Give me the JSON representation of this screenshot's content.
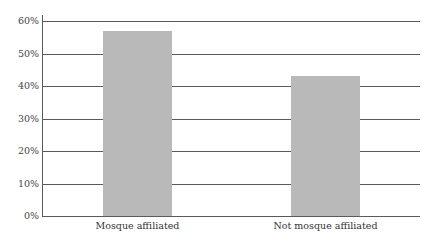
{
  "chart_data": {
    "type": "bar",
    "title": "",
    "xlabel": "",
    "ylabel": "",
    "categories": [
      "Mosque affiliated",
      "Not mosque affiliated"
    ],
    "values": [
      57,
      43
    ],
    "unit": "%",
    "ylim": [
      0,
      60
    ],
    "yticks": [
      "0%",
      "10%",
      "20%",
      "30%",
      "40%",
      "50%",
      "60%"
    ],
    "grid": true,
    "legend": null,
    "colors": {
      "bar": "#b9b9b9",
      "grid": "#5a5a5a"
    }
  }
}
